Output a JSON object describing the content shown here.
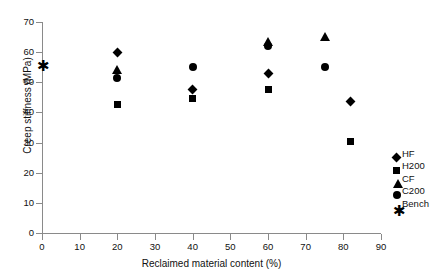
{
  "chart_data": {
    "type": "scatter",
    "title": "",
    "xlabel": "Reclaimed material content (%)",
    "ylabel": "Creep stiffness (MPa)",
    "xlim": [
      0,
      90
    ],
    "ylim": [
      0,
      70
    ],
    "xticks": [
      0,
      10,
      20,
      30,
      40,
      50,
      60,
      70,
      80,
      90
    ],
    "yticks": [
      0,
      10,
      20,
      30,
      40,
      50,
      60,
      70
    ],
    "grid": false,
    "legend_position": "right",
    "series": [
      {
        "name": "HF",
        "marker": "diamond",
        "color": "#000000",
        "points": [
          {
            "x": 20,
            "y": 60.0
          },
          {
            "x": 40,
            "y": 47.5
          },
          {
            "x": 60,
            "y": 53.0
          },
          {
            "x": 82,
            "y": 43.5
          }
        ]
      },
      {
        "name": "H200",
        "marker": "square",
        "color": "#000000",
        "points": [
          {
            "x": 20,
            "y": 42.5
          },
          {
            "x": 40,
            "y": 44.5
          },
          {
            "x": 60,
            "y": 47.5
          },
          {
            "x": 82,
            "y": 30.5
          }
        ]
      },
      {
        "name": "CF",
        "marker": "triangle",
        "color": "#000000",
        "points": [
          {
            "x": 20,
            "y": 54.0
          },
          {
            "x": 60,
            "y": 63.5
          },
          {
            "x": 75,
            "y": 65.0
          }
        ]
      },
      {
        "name": "C200",
        "marker": "circle",
        "color": "#000000",
        "points": [
          {
            "x": 20,
            "y": 51.5
          },
          {
            "x": 40,
            "y": 55.0
          },
          {
            "x": 60,
            "y": 62.0
          },
          {
            "x": 75,
            "y": 55.0
          }
        ]
      },
      {
        "name": "Bench",
        "marker": "asterisk",
        "color": "#000000",
        "points": [
          {
            "x": 0,
            "y": 55.0
          }
        ]
      }
    ],
    "legend": [
      {
        "label": "HF",
        "marker": "diamond"
      },
      {
        "label": "H200",
        "marker": "square"
      },
      {
        "label": "CF",
        "marker": "triangle"
      },
      {
        "label": "C200",
        "marker": "circle"
      },
      {
        "label": "Bench",
        "marker": "asterisk"
      }
    ]
  }
}
